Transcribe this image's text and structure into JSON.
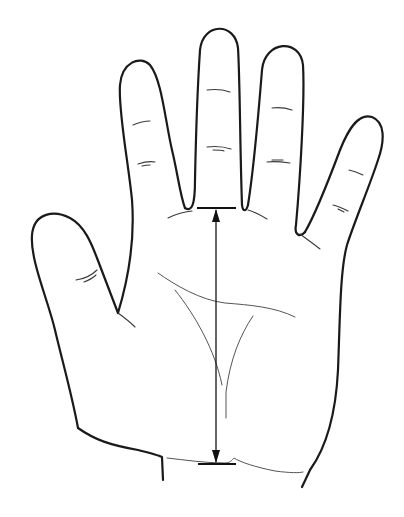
{
  "figure": {
    "annotation": "vertical double-headed measurement arrow from base of middle finger to wrist crease",
    "colors": {
      "background": "#ffffff",
      "outline": "#1a1a1a",
      "lines": "#555555"
    },
    "parts": [
      "thumb",
      "index-finger",
      "middle-finger",
      "ring-finger",
      "little-finger",
      "palm",
      "wrist",
      "heart-line",
      "head-line",
      "fate-line",
      "measurement-arrow"
    ]
  }
}
